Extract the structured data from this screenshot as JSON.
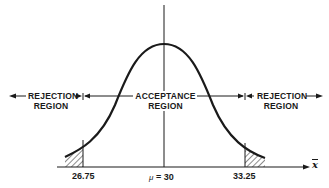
{
  "diagram": {
    "type": "normal-distribution-hypothesis-test",
    "regions": {
      "left_rejection": {
        "line1": "REJECTION",
        "line2": "REGION"
      },
      "acceptance": {
        "line1": "ACCEPTANCE",
        "line2": "REGION"
      },
      "right_rejection": {
        "line1": "REJECTION",
        "line2": "REGION"
      }
    },
    "axis": {
      "variable_label": "x",
      "lower_critical_value": "26.75",
      "mean_label": "μ = 30",
      "mean_symbol": "μ",
      "mean_value": "= 30",
      "upper_critical_value": "33.25"
    },
    "colors": {
      "ink": "#1a1a1a",
      "background": "#ffffff"
    }
  }
}
